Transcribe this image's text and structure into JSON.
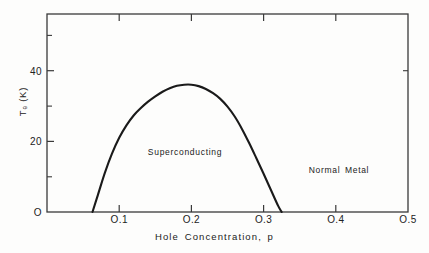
{
  "figure": {
    "background_color": "#fdfdfc",
    "line_color": "#1a1a1a",
    "axis_color": "#3a3a3a"
  },
  "axes": {
    "x_title": "Hole  Concentration, p",
    "y_title": "Tₑ (K)",
    "x_ticks": [
      {
        "value": 0.1,
        "label": "O.1"
      },
      {
        "value": 0.2,
        "label": "O.2"
      },
      {
        "value": 0.3,
        "label": "O.3"
      },
      {
        "value": 0.4,
        "label": "O.4"
      },
      {
        "value": 0.5,
        "label": "O.5"
      }
    ],
    "y_ticks": [
      {
        "value": 0,
        "label": "O"
      },
      {
        "value": 20,
        "label": "20"
      },
      {
        "value": 40,
        "label": "40"
      }
    ],
    "y_minor_ticks": [
      10,
      30,
      50
    ]
  },
  "annotations": [
    {
      "name": "superconducting",
      "text": "Superconducting"
    },
    {
      "name": "normal-metal",
      "text": "Normal Metal"
    }
  ],
  "chart_data": {
    "type": "line",
    "title": "",
    "xlabel": "Hole Concentration, p",
    "ylabel": "Tc (K)",
    "xlim": [
      0.0,
      0.5
    ],
    "ylim": [
      0,
      56
    ],
    "grid": false,
    "legend": "none",
    "series": [
      {
        "name": "Superconducting dome (Tc vs hole concentration)",
        "x": [
          0.063,
          0.07,
          0.08,
          0.09,
          0.1,
          0.11,
          0.12,
          0.13,
          0.14,
          0.15,
          0.16,
          0.17,
          0.18,
          0.19,
          0.2,
          0.21,
          0.22,
          0.23,
          0.24,
          0.25,
          0.26,
          0.27,
          0.28,
          0.29,
          0.3,
          0.31,
          0.32,
          0.325
        ],
        "y": [
          0.0,
          4.5,
          11.0,
          16.5,
          21.0,
          24.5,
          27.3,
          29.4,
          31.2,
          32.7,
          34.0,
          35.0,
          35.7,
          36.0,
          36.0,
          35.6,
          34.8,
          33.6,
          32.0,
          29.8,
          27.0,
          23.5,
          19.5,
          15.2,
          10.8,
          6.3,
          1.8,
          0.0
        ]
      }
    ],
    "annotations": [
      {
        "text": "Superconducting",
        "x": 0.192,
        "y": 17.0
      },
      {
        "text": "Normal Metal",
        "x": 0.406,
        "y": 12.0
      }
    ]
  }
}
